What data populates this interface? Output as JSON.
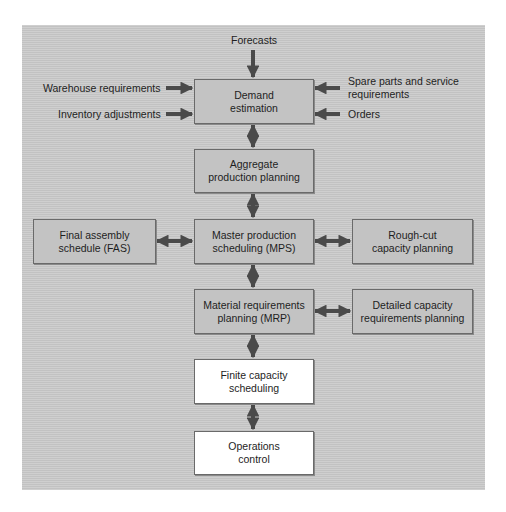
{
  "diagram": {
    "type": "flowchart",
    "inputs": {
      "top": "Forecasts",
      "left": [
        "Warehouse requirements",
        "Inventory adjustments"
      ],
      "right": [
        "Spare parts and service requirements",
        "Orders"
      ],
      "right_lines": [
        "Spare parts and service",
        "requirements"
      ]
    },
    "nodes": {
      "demand": {
        "line1": "Demand",
        "line2": "estimation",
        "style": "shaded"
      },
      "aggregate": {
        "line1": "Aggregate",
        "line2": "production planning",
        "style": "shaded"
      },
      "fas": {
        "line1": "Final assembly",
        "line2": "schedule (FAS)",
        "style": "shaded"
      },
      "mps": {
        "line1": "Master production",
        "line2": "scheduling (MPS)",
        "style": "shaded"
      },
      "roughcut": {
        "line1": "Rough-cut",
        "line2": "capacity planning",
        "style": "shaded"
      },
      "mrp": {
        "line1": "Material requirements",
        "line2": "planning (MRP)",
        "style": "shaded"
      },
      "detailed": {
        "line1": "Detailed capacity",
        "line2": "requirements planning",
        "style": "shaded"
      },
      "finite": {
        "line1": "Finite capacity",
        "line2": "scheduling",
        "style": "white"
      },
      "operations": {
        "line1": "Operations",
        "line2": "control",
        "style": "white"
      }
    },
    "edges": [
      {
        "from": "Forecasts",
        "to": "demand",
        "dir": "one-way"
      },
      {
        "from": "Warehouse requirements",
        "to": "demand",
        "dir": "one-way"
      },
      {
        "from": "Inventory adjustments",
        "to": "demand",
        "dir": "one-way"
      },
      {
        "from": "Spare parts and service requirements",
        "to": "demand",
        "dir": "one-way"
      },
      {
        "from": "Orders",
        "to": "demand",
        "dir": "one-way"
      },
      {
        "from": "demand",
        "to": "aggregate",
        "dir": "two-way"
      },
      {
        "from": "aggregate",
        "to": "mps",
        "dir": "two-way"
      },
      {
        "from": "fas",
        "to": "mps",
        "dir": "two-way"
      },
      {
        "from": "mps",
        "to": "roughcut",
        "dir": "two-way"
      },
      {
        "from": "mps",
        "to": "mrp",
        "dir": "two-way"
      },
      {
        "from": "mrp",
        "to": "detailed",
        "dir": "two-way"
      },
      {
        "from": "mrp",
        "to": "finite",
        "dir": "two-way"
      },
      {
        "from": "finite",
        "to": "operations",
        "dir": "two-way"
      }
    ],
    "colors": {
      "background": "#c9c9c9",
      "box_shaded": "#c3c3c3",
      "box_white": "#ffffff",
      "arrow": "#4a4a4a"
    }
  }
}
